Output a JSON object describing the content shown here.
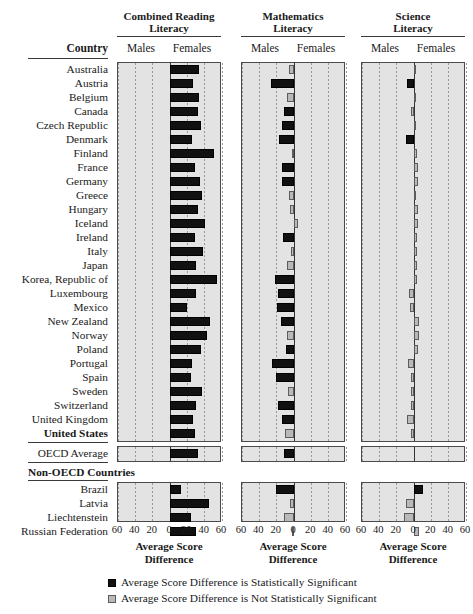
{
  "figure": {
    "country_header": "Country",
    "non_oecd_header": "Non-OECD Countries",
    "axis_label_line1": "Average Score",
    "axis_label_line2": "Difference",
    "tick_labels": [
      "60",
      "40",
      "20",
      "0",
      "20",
      "40",
      "60"
    ],
    "male_label": "Males",
    "female_label": "Females",
    "legend": [
      {
        "swatch": "sig",
        "text": "Average Score Difference is Statistically Significant"
      },
      {
        "swatch": "nsig",
        "text": "Average Score Difference is Not Statistically Significant"
      }
    ],
    "colors": {
      "significant": "#111111",
      "not_significant": "#b9b9b9",
      "panel_background": "#e3e3e3",
      "axis": "#333333"
    }
  },
  "chart_data": {
    "type": "bar",
    "orientation": "horizontal-diverging",
    "xlabel": "Average Score Difference",
    "ylabel": "Country",
    "xlim": [
      -60,
      60
    ],
    "xticks": [
      -60,
      -40,
      -20,
      0,
      20,
      40,
      60
    ],
    "xticklabels": [
      "60",
      "40",
      "20",
      "0",
      "20",
      "40",
      "60"
    ],
    "grid": true,
    "note": "Positive values favor Females (bar extends right of zero); negative values favor Males (bar extends left of zero).",
    "panels": [
      {
        "key": "reading",
        "title_line1": "Combined Reading",
        "title_line2": "Literacy"
      },
      {
        "key": "math",
        "title_line1": "Mathematics",
        "title_line2": "Literacy"
      },
      {
        "key": "science",
        "title_line1": "Science",
        "title_line2": "Literacy"
      }
    ],
    "legend_entries": [
      "Average Score Difference is Statistically Significant",
      "Average Score Difference is Not Statistically Significant"
    ],
    "groups": [
      {
        "name": "OECD Countries",
        "rows": [
          {
            "country": "Australia",
            "bold": false,
            "reading": {
              "value": 34,
              "significant": true
            },
            "math": {
              "value": -6,
              "significant": false
            },
            "science": {
              "value": 2,
              "significant": false
            }
          },
          {
            "country": "Austria",
            "bold": false,
            "reading": {
              "value": 26,
              "significant": true
            },
            "math": {
              "value": -27,
              "significant": true
            },
            "science": {
              "value": -8,
              "significant": true
            }
          },
          {
            "country": "Belgium",
            "bold": false,
            "reading": {
              "value": 33,
              "significant": true
            },
            "math": {
              "value": -8,
              "significant": false
            },
            "science": {
              "value": 1,
              "significant": false
            }
          },
          {
            "country": "Canada",
            "bold": false,
            "reading": {
              "value": 32,
              "significant": true
            },
            "math": {
              "value": -11,
              "significant": true
            },
            "science": {
              "value": -3,
              "significant": false
            }
          },
          {
            "country": "Czech Republic",
            "bold": false,
            "reading": {
              "value": 36,
              "significant": true
            },
            "math": {
              "value": -14,
              "significant": true
            },
            "science": {
              "value": 1,
              "significant": false
            }
          },
          {
            "country": "Denmark",
            "bold": false,
            "reading": {
              "value": 25,
              "significant": true
            },
            "math": {
              "value": -17,
              "significant": true
            },
            "science": {
              "value": -9,
              "significant": true
            }
          },
          {
            "country": "Finland",
            "bold": false,
            "reading": {
              "value": 51,
              "significant": true
            },
            "math": {
              "value": -2,
              "significant": false
            },
            "science": {
              "value": 3,
              "significant": false
            }
          },
          {
            "country": "France",
            "bold": false,
            "reading": {
              "value": 29,
              "significant": true
            },
            "math": {
              "value": -14,
              "significant": true
            },
            "science": {
              "value": 5,
              "significant": false
            }
          },
          {
            "country": "Germany",
            "bold": false,
            "reading": {
              "value": 35,
              "significant": true
            },
            "math": {
              "value": -14,
              "significant": true
            },
            "science": {
              "value": 5,
              "significant": false
            }
          },
          {
            "country": "Greece",
            "bold": false,
            "reading": {
              "value": 37,
              "significant": true
            },
            "math": {
              "value": -6,
              "significant": false
            },
            "science": {
              "value": 2,
              "significant": false
            }
          },
          {
            "country": "Hungary",
            "bold": false,
            "reading": {
              "value": 32,
              "significant": true
            },
            "math": {
              "value": -5,
              "significant": false
            },
            "science": {
              "value": 5,
              "significant": false
            }
          },
          {
            "country": "Iceland",
            "bold": false,
            "reading": {
              "value": 40,
              "significant": true
            },
            "math": {
              "value": 5,
              "significant": false
            },
            "science": {
              "value": 5,
              "significant": false
            }
          },
          {
            "country": "Ireland",
            "bold": false,
            "reading": {
              "value": 29,
              "significant": true
            },
            "math": {
              "value": -13,
              "significant": true
            },
            "science": {
              "value": 4,
              "significant": false
            }
          },
          {
            "country": "Italy",
            "bold": false,
            "reading": {
              "value": 38,
              "significant": true
            },
            "math": {
              "value": -4,
              "significant": false
            },
            "science": {
              "value": 3,
              "significant": false
            }
          },
          {
            "country": "Japan",
            "bold": false,
            "reading": {
              "value": 30,
              "significant": true
            },
            "math": {
              "value": -8,
              "significant": false
            },
            "science": {
              "value": 4,
              "significant": false
            }
          },
          {
            "country": "Korea, Republic of",
            "bold": false,
            "reading": {
              "value": 54,
              "significant": true
            },
            "math": {
              "value": -22,
              "significant": true
            },
            "science": {
              "value": 4,
              "significant": false
            }
          },
          {
            "country": "Luxembourg",
            "bold": false,
            "reading": {
              "value": 30,
              "significant": true
            },
            "math": {
              "value": -19,
              "significant": true
            },
            "science": {
              "value": -6,
              "significant": false
            }
          },
          {
            "country": "Mexico",
            "bold": false,
            "reading": {
              "value": 20,
              "significant": true
            },
            "math": {
              "value": -20,
              "significant": true
            },
            "science": {
              "value": -5,
              "significant": false
            }
          },
          {
            "country": "New Zealand",
            "bold": false,
            "reading": {
              "value": 46,
              "significant": true
            },
            "math": {
              "value": -15,
              "significant": true
            },
            "science": {
              "value": 6,
              "significant": false
            }
          },
          {
            "country": "Norway",
            "bold": false,
            "reading": {
              "value": 43,
              "significant": true
            },
            "math": {
              "value": -8,
              "significant": false
            },
            "science": {
              "value": 6,
              "significant": false
            }
          },
          {
            "country": "Poland",
            "bold": false,
            "reading": {
              "value": 36,
              "significant": true
            },
            "math": {
              "value": -9,
              "significant": true
            },
            "science": {
              "value": 5,
              "significant": false
            }
          },
          {
            "country": "Portugal",
            "bold": false,
            "reading": {
              "value": 25,
              "significant": true
            },
            "math": {
              "value": -25,
              "significant": true
            },
            "science": {
              "value": -7,
              "significant": false
            }
          },
          {
            "country": "Spain",
            "bold": false,
            "reading": {
              "value": 24,
              "significant": true
            },
            "math": {
              "value": -21,
              "significant": true
            },
            "science": {
              "value": -4,
              "significant": false
            }
          },
          {
            "country": "Sweden",
            "bold": false,
            "reading": {
              "value": 37,
              "significant": true
            },
            "math": {
              "value": -7,
              "significant": false
            },
            "science": {
              "value": -4,
              "significant": false
            }
          },
          {
            "country": "Switzerland",
            "bold": false,
            "reading": {
              "value": 30,
              "significant": true
            },
            "math": {
              "value": -18,
              "significant": true
            },
            "science": {
              "value": -3,
              "significant": false
            }
          },
          {
            "country": "United Kingdom",
            "bold": false,
            "reading": {
              "value": 26,
              "significant": true
            },
            "math": {
              "value": -14,
              "significant": true
            },
            "science": {
              "value": -8,
              "significant": false
            }
          },
          {
            "country": "United States",
            "bold": true,
            "reading": {
              "value": 29,
              "significant": true
            },
            "math": {
              "value": -10,
              "significant": false
            },
            "science": {
              "value": -3,
              "significant": false
            }
          }
        ]
      },
      {
        "name": "OECD Average",
        "rows": [
          {
            "country": "OECD Average",
            "bold": false,
            "reading": {
              "value": 32,
              "significant": true
            },
            "math": {
              "value": -11,
              "significant": true
            },
            "science": {
              "value": 0,
              "significant": false
            }
          }
        ]
      },
      {
        "name": "Non-OECD Countries",
        "rows": [
          {
            "country": "Brazil",
            "bold": false,
            "reading": {
              "value": 13,
              "significant": true
            },
            "math": {
              "value": -21,
              "significant": true
            },
            "science": {
              "value": 10,
              "significant": true
            }
          },
          {
            "country": "Latvia",
            "bold": false,
            "reading": {
              "value": 45,
              "significant": true
            },
            "math": {
              "value": -5,
              "significant": false
            },
            "science": {
              "value": -9,
              "significant": false
            }
          },
          {
            "country": "Liechtenstein",
            "bold": false,
            "reading": {
              "value": 24,
              "significant": true
            },
            "math": {
              "value": -12,
              "significant": false
            },
            "science": {
              "value": -11,
              "significant": false
            }
          },
          {
            "country": "Russian Federation",
            "bold": false,
            "reading": {
              "value": 30,
              "significant": true
            },
            "math": {
              "value": -2,
              "significant": false
            },
            "science": {
              "value": 6,
              "significant": false
            }
          }
        ]
      }
    ]
  }
}
